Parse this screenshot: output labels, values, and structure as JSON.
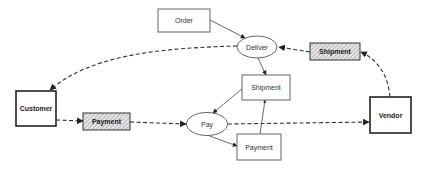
{
  "diagram": {
    "nodes": {
      "order": {
        "label": "Order",
        "shape": "rectangle",
        "style": "plain"
      },
      "deliver": {
        "label": "Deliver",
        "shape": "ellipse",
        "style": "plain"
      },
      "shipment_flow": {
        "label": "Shipment",
        "shape": "rectangle",
        "style": "hatched"
      },
      "shipment": {
        "label": "Shipment",
        "shape": "rectangle",
        "style": "plain"
      },
      "customer": {
        "label": "Customer",
        "shape": "rectangle",
        "style": "bold"
      },
      "payment_flow": {
        "label": "Payment",
        "shape": "rectangle",
        "style": "hatched"
      },
      "pay": {
        "label": "Pay",
        "shape": "ellipse",
        "style": "plain"
      },
      "payment": {
        "label": "Payment",
        "shape": "rectangle",
        "style": "plain"
      },
      "vendor": {
        "label": "Vendor",
        "shape": "rectangle",
        "style": "bold"
      }
    },
    "edges": [
      {
        "from": "Order",
        "to": "Deliver",
        "style": "solid"
      },
      {
        "from": "Deliver",
        "to": "Shipment",
        "style": "solid"
      },
      {
        "from": "Shipment",
        "to": "Pay",
        "style": "solid"
      },
      {
        "from": "Pay",
        "to": "Payment",
        "style": "solid"
      },
      {
        "from": "Payment",
        "to": "Shipment",
        "style": "solid"
      },
      {
        "from": "Deliver",
        "to": "Customer",
        "style": "dashed"
      },
      {
        "from": "Customer",
        "to": "Payment (flow)",
        "style": "dashed"
      },
      {
        "from": "Payment (flow)",
        "to": "Pay",
        "style": "dashed"
      },
      {
        "from": "Pay",
        "to": "Vendor",
        "style": "dashed"
      },
      {
        "from": "Vendor",
        "to": "Shipment (flow)",
        "style": "dashed"
      },
      {
        "from": "Shipment (flow)",
        "to": "Deliver",
        "style": "dashed"
      }
    ],
    "colors": {
      "background": "#ffffff",
      "stroke": "#333333",
      "hatch": "#888888"
    }
  }
}
